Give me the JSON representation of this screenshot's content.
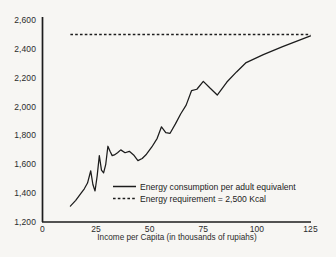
{
  "chart_data": {
    "type": "line",
    "title": "",
    "subtitle": "",
    "xlabel": "Income per Capita (in thousands of rupiahs)",
    "ylabel": "",
    "xlim": [
      0,
      125
    ],
    "ylim": [
      1200,
      2600
    ],
    "xticks": [
      0,
      25,
      50,
      75,
      100,
      125
    ],
    "xtick_labels": [
      "0",
      "25",
      "50",
      "75",
      "100",
      "125"
    ],
    "yticks": [
      1200,
      1400,
      1600,
      1800,
      2000,
      2200,
      2400,
      2600
    ],
    "ytick_labels": [
      "1,200",
      "1,400",
      "1,600",
      "1,800",
      "2,000",
      "2,200",
      "2,400",
      "2,600"
    ],
    "grid": false,
    "legend_position": "lower right",
    "series": [
      {
        "name": "Energy consumption per adult equivalent",
        "style": "solid",
        "color": "#1c1c1c",
        "x": [
          13.0,
          15.5,
          18.0,
          19.5,
          21.0,
          22.5,
          23.5,
          24.5,
          25.5,
          26.5,
          27.5,
          28.5,
          29.5,
          30.5,
          31.5,
          32.5,
          33.5,
          35.0,
          36.5,
          38.5,
          40.5,
          42.5,
          44.5,
          46.5,
          48.5,
          51.0,
          53.5,
          55.5,
          57.5,
          59.5,
          62.0,
          64.5,
          67.0,
          69.5,
          72.0,
          75.0,
          78.0,
          81.5,
          86.0,
          90.5,
          95.0,
          103.0,
          112.0,
          125.0
        ],
        "y": [
          1310,
          1350,
          1400,
          1430,
          1470,
          1555,
          1460,
          1415,
          1520,
          1660,
          1560,
          1540,
          1600,
          1725,
          1690,
          1660,
          1665,
          1680,
          1700,
          1680,
          1690,
          1665,
          1625,
          1640,
          1670,
          1720,
          1780,
          1860,
          1820,
          1815,
          1880,
          1950,
          2010,
          2110,
          2120,
          2175,
          2130,
          2080,
          2170,
          2240,
          2305,
          2360,
          2415,
          2490
        ]
      },
      {
        "name": "Energy requirement = 2,500 Kcal",
        "style": "dashed",
        "color": "#1c1c1c",
        "x": [
          13.0,
          125.0
        ],
        "y": [
          2500,
          2500
        ]
      }
    ],
    "legend": [
      {
        "label": "Energy consumption per adult equivalent",
        "style": "solid"
      },
      {
        "label": "Energy requirement = 2,500 Kcal",
        "style": "dashed"
      }
    ]
  },
  "axes": {
    "colors": {
      "axis_line": "#1c1c1c",
      "text": "#2b2b2b",
      "background": "#f7f6f3",
      "series": "#1c1c1c"
    }
  }
}
